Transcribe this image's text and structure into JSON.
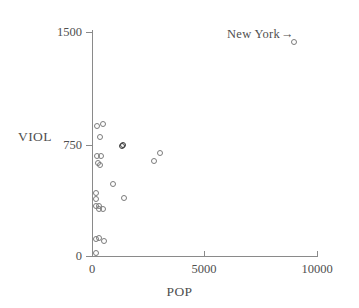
{
  "chart_data": {
    "type": "scatter",
    "title": "",
    "xlabel": "POP",
    "ylabel": "VIOL",
    "xlim": [
      0,
      10000
    ],
    "ylim": [
      0,
      1500
    ],
    "xticks": [
      0,
      5000,
      10000
    ],
    "xtick_labels": [
      "0",
      "5000",
      "10000"
    ],
    "yticks": [
      0,
      750,
      1500
    ],
    "ytick_labels": [
      "0",
      "750",
      "1500"
    ],
    "grid": false,
    "legend": "none",
    "annotations": [
      {
        "text": "New York",
        "arrow": "→",
        "points_to_x": 8950,
        "points_to_y": 1440
      }
    ],
    "points": [
      {
        "x": 8950,
        "y": 1440,
        "label": "New York"
      },
      {
        "x": 170,
        "y": 880
      },
      {
        "x": 430,
        "y": 890
      },
      {
        "x": 330,
        "y": 805
      },
      {
        "x": 1280,
        "y": 745,
        "emphasis": true
      },
      {
        "x": 1330,
        "y": 748,
        "emphasis": true
      },
      {
        "x": 180,
        "y": 680
      },
      {
        "x": 340,
        "y": 675
      },
      {
        "x": 200,
        "y": 630
      },
      {
        "x": 300,
        "y": 615
      },
      {
        "x": 2980,
        "y": 700
      },
      {
        "x": 2720,
        "y": 645
      },
      {
        "x": 880,
        "y": 490
      },
      {
        "x": 120,
        "y": 430
      },
      {
        "x": 120,
        "y": 390
      },
      {
        "x": 1370,
        "y": 395
      },
      {
        "x": 135,
        "y": 345
      },
      {
        "x": 250,
        "y": 320
      },
      {
        "x": 280,
        "y": 345
      },
      {
        "x": 420,
        "y": 320
      },
      {
        "x": 130,
        "y": 120
      },
      {
        "x": 270,
        "y": 125
      },
      {
        "x": 470,
        "y": 105
      },
      {
        "x": 110,
        "y": 30
      }
    ]
  },
  "axes": {
    "y_title": "VIOL",
    "x_title": "POP",
    "y_tick_labels": [
      "1500",
      "750",
      "0"
    ],
    "x_tick_labels": [
      "0",
      "5000",
      "10000"
    ]
  },
  "annotation": {
    "new_york_label": "New York",
    "arrow": "→"
  },
  "colors": {
    "axis": "#8a8a8a",
    "marker": "#7c7c7c",
    "marker_emphasis": "#3a3a3a",
    "text": "#4f4f4f",
    "background": "#ffffff"
  }
}
